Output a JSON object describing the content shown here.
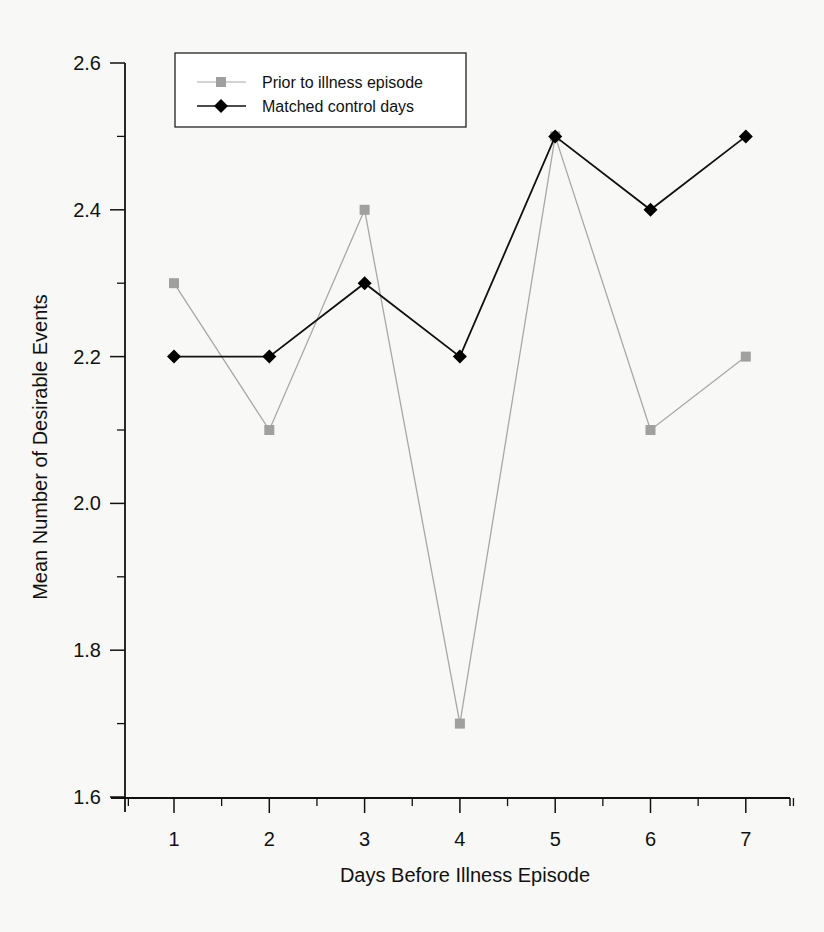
{
  "chart_data": {
    "type": "line",
    "title": "",
    "xlabel": "Days Before Illness Episode",
    "ylabel": "Mean Number of Desirable Events",
    "x": [
      1,
      2,
      3,
      4,
      5,
      6,
      7
    ],
    "x_tick_labels": [
      "1",
      "2",
      "3",
      "4",
      "5",
      "6",
      "7"
    ],
    "y_tick_labels": [
      "1.6",
      "1.8",
      "2.0",
      "2.2",
      "2.4",
      "2.6"
    ],
    "y_ticks": [
      1.6,
      1.8,
      2.0,
      2.2,
      2.4,
      2.6
    ],
    "ylim": [
      1.6,
      2.6
    ],
    "xlim": [
      0.5,
      7.5
    ],
    "grid": false,
    "legend_position": "upper-left",
    "series": [
      {
        "name": "Prior to illness episode",
        "values": [
          2.3,
          2.1,
          2.4,
          1.7,
          2.5,
          2.1,
          2.2
        ],
        "color": "#a8a8a8",
        "marker": "square"
      },
      {
        "name": "Matched control days",
        "values": [
          2.2,
          2.2,
          2.3,
          2.2,
          2.5,
          2.4,
          2.5
        ],
        "color": "#111111",
        "marker": "diamond"
      }
    ]
  },
  "legend": {
    "items": [
      {
        "label": "Prior to illness episode"
      },
      {
        "label": "Matched control days"
      }
    ]
  }
}
